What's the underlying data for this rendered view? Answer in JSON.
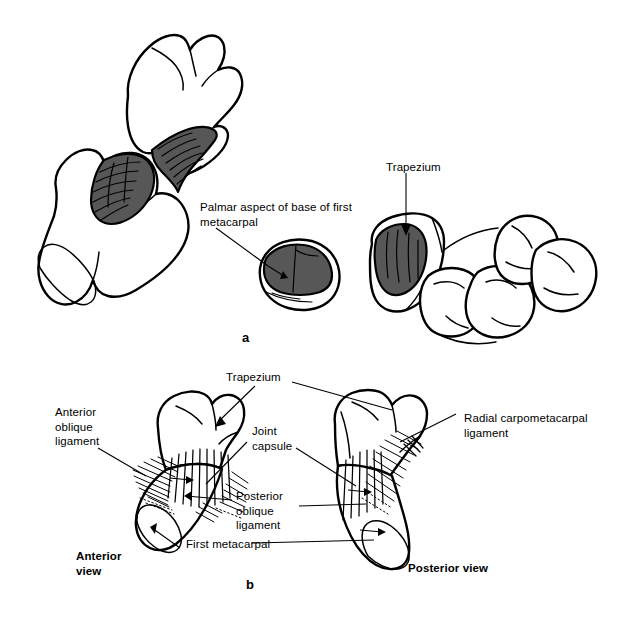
{
  "figure": {
    "background_color": "#ffffff",
    "ink_color": "#000000",
    "facet_shade_color": "#575757",
    "width": 624,
    "height": 622
  },
  "panels": [
    {
      "letter": "a",
      "caption": "Disarticulated trapezium and first metacarpal showing the reciprocal saddle-shaped articular surfaces"
    },
    {
      "letter": "b",
      "caption": "Ligaments of the first carpometacarpal joint in anterior and posterior views"
    }
  ],
  "labels": {
    "palmar_aspect": "Palmar aspect of base of first\nmetacarpal",
    "trapezium_top": "Trapezium",
    "trapezium_bottom": "Trapezium",
    "anterior_oblique_ligament": "Anterior\noblique\nligament",
    "joint_capsule": "Joint\ncapsule",
    "radial_carpometacarpal_ligament": "Radial carpometacarpal\nligament",
    "posterior_oblique_ligament": "Posterior\noblique\nligament",
    "first_metacarpal": "First metacarpal",
    "anterior_view": "Anterior\nview",
    "posterior_view": "Posterior view"
  },
  "panel_letters": {
    "a": "a",
    "b": "b"
  },
  "structures": [
    {
      "name": "trapezium",
      "panel": "a",
      "shaded_surface": true
    },
    {
      "name": "first-metacarpal",
      "panel": "a",
      "shaded_surface": true
    },
    {
      "name": "metacarpal-base-cross-section",
      "panel": "a",
      "shaded_surface": true
    },
    {
      "name": "distal-carpal-row",
      "panel": "a",
      "shaded_surface": true
    },
    {
      "name": "anterior-view-joint",
      "panel": "b",
      "shaded_surface": false
    },
    {
      "name": "posterior-view-joint",
      "panel": "b",
      "shaded_surface": false
    }
  ]
}
